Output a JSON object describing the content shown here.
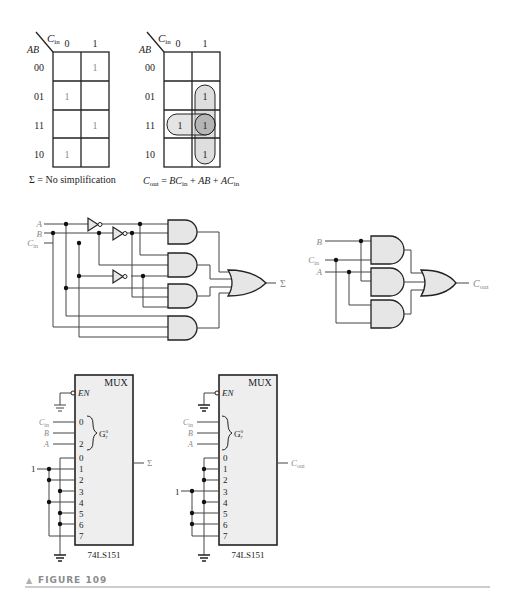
{
  "figure": {
    "caption": "FIGURE 109",
    "caption_marker": "▲"
  },
  "kmap_sum": {
    "col_var": "C",
    "col_var_sub": "in",
    "row_var": "AB",
    "col_headers": [
      "0",
      "1"
    ],
    "row_headers": [
      "00",
      "01",
      "11",
      "10"
    ],
    "cells": [
      [
        "",
        "1"
      ],
      [
        "1",
        ""
      ],
      [
        "",
        "1"
      ],
      [
        "1",
        ""
      ]
    ],
    "result_label": "Σ = No simplification"
  },
  "kmap_cout": {
    "col_var": "C",
    "col_var_sub": "in",
    "row_var": "AB",
    "col_headers": [
      "0",
      "1"
    ],
    "row_headers": [
      "00",
      "01",
      "11",
      "10"
    ],
    "cells": [
      [
        "",
        ""
      ],
      [
        "",
        "1"
      ],
      [
        "1",
        "1"
      ],
      [
        "",
        "1"
      ]
    ],
    "groupings": [
      "BCin (rows 01,11 col 1)",
      "AB (row 11)",
      "ACin (rows 11,10 col 1)"
    ],
    "result": {
      "lhs": "C",
      "lhs_sub": "out",
      "eq": " = ",
      "t1": "BC",
      "t1_sub": "in",
      "plus1": " + ",
      "t2": "AB",
      "plus2": " + ",
      "t3": "AC",
      "t3_sub": "in"
    }
  },
  "sum_circuit": {
    "inputs": [
      "A",
      "B",
      "C"
    ],
    "input_cin_sub": "in",
    "output": "Σ"
  },
  "cout_circuit": {
    "inputs": [
      "B",
      "C",
      "A"
    ],
    "input_cin_sub": "in",
    "output": "C",
    "output_sub": "out"
  },
  "mux_sum": {
    "title": "MUX",
    "enable": "EN",
    "select_inputs": [
      "C",
      "B",
      "A"
    ],
    "select_cin_sub": "in",
    "select_pins": [
      "0",
      "",
      "2"
    ],
    "group_label": "G",
    "group_sup": "0",
    "group_sub": "7",
    "data_pins": [
      "0",
      "1",
      "2",
      "3",
      "4",
      "5",
      "6",
      "7"
    ],
    "logic_one": "1",
    "output": "Σ",
    "part": "74LS151"
  },
  "mux_cout": {
    "title": "MUX",
    "enable": "EN",
    "select_inputs": [
      "C",
      "B",
      "A"
    ],
    "select_cin_sub": "in",
    "select_pins": [
      "0",
      "",
      "2"
    ],
    "group_label": "G",
    "group_sup": "0",
    "group_sub": "7",
    "data_pins": [
      "0",
      "1",
      "2",
      "3",
      "4",
      "5",
      "6",
      "7"
    ],
    "logic_one": "1",
    "output": "C",
    "output_sub": "out",
    "part": "74LS151"
  }
}
